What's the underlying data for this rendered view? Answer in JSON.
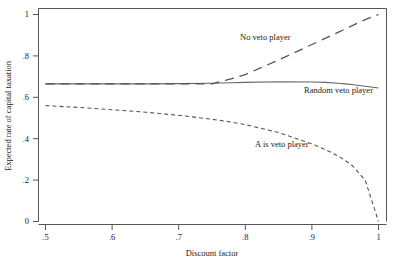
{
  "chart_data": {
    "type": "line",
    "title": "",
    "xlabel": "Discount factor",
    "ylabel": "Expected rate of capital taxation",
    "xlim": [
      0.5,
      1.0
    ],
    "ylim": [
      0,
      1
    ],
    "xticks": [
      ".5",
      ".6",
      ".7",
      ".8",
      ".9",
      "1"
    ],
    "xtick_values": [
      0.5,
      0.6,
      0.7,
      0.8,
      0.9,
      1.0
    ],
    "yticks": [
      "0",
      ".2",
      ".4",
      ".6",
      ".8",
      "1"
    ],
    "ytick_values": [
      0,
      0.2,
      0.4,
      0.6,
      0.8,
      1.0
    ],
    "grid": false,
    "legend_position": "inline-annotations",
    "x": [
      0.5,
      0.55,
      0.6,
      0.65,
      0.7,
      0.75,
      0.78,
      0.8,
      0.85,
      0.9,
      0.92,
      0.94,
      0.95,
      0.96,
      0.98,
      1.0
    ],
    "series": [
      {
        "name": "No veto player",
        "style": "long-dash",
        "values": [
          0.665,
          0.665,
          0.665,
          0.665,
          0.665,
          0.665,
          0.69,
          0.71,
          0.78,
          0.855,
          0.885,
          0.915,
          0.93,
          0.945,
          0.975,
          1.0
        ],
        "branch_point": 0.754,
        "end_value": 1.0
      },
      {
        "name": "Random veto player",
        "style": "solid",
        "values": [
          0.665,
          0.665,
          0.665,
          0.665,
          0.666,
          0.668,
          0.67,
          0.672,
          0.675,
          0.674,
          0.672,
          0.668,
          0.665,
          0.662,
          0.653,
          0.645
        ],
        "start_value": 0.665,
        "end_value": 0.645
      },
      {
        "name": "A is veto player",
        "style": "short-dash",
        "values": [
          0.56,
          0.551,
          0.54,
          0.528,
          0.513,
          0.494,
          0.48,
          0.468,
          0.43,
          0.375,
          0.348,
          0.315,
          0.295,
          0.272,
          0.2,
          0.0
        ],
        "start_value": 0.56,
        "end_value": 0.0
      }
    ],
    "annotations": [
      {
        "text": "No veto player",
        "x": 0.83,
        "y": 0.89
      },
      {
        "text": "Random veto player",
        "x": 0.94,
        "y": 0.635
      },
      {
        "text": "A is veto player",
        "x": 0.855,
        "y": 0.375
      }
    ],
    "colors": {
      "axis": "#555555",
      "solid_line": "#666666",
      "dashed_line": "#555555",
      "background": "#ffffff",
      "text": "#1a1a1a"
    }
  }
}
